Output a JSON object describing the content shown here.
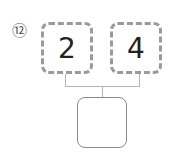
{
  "problem": {
    "number_label": "⑫",
    "boxes": [
      {
        "value": "2"
      },
      {
        "value": "4"
      }
    ],
    "answer_box": {
      "value": ""
    }
  }
}
